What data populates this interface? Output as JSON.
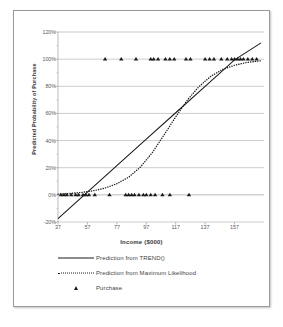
{
  "chart_data": {
    "type": "scatter",
    "title": "",
    "xlabel": "Income ($000)",
    "ylabel": "Predicted Probability of Purchase",
    "xlim": [
      37,
      177
    ],
    "ylim": [
      -0.2,
      1.2
    ],
    "xticks": [
      "37",
      "57",
      "77",
      "97",
      "117",
      "137",
      "157"
    ],
    "xtick_values": [
      37,
      57,
      77,
      97,
      117,
      137,
      157
    ],
    "yticks": [
      "-20%",
      "0%",
      "20%",
      "40%",
      "60%",
      "80%",
      "100%",
      "120%"
    ],
    "ytick_values": [
      -0.2,
      0.0,
      0.2,
      0.4,
      0.6,
      0.8,
      1.0,
      1.2
    ],
    "grid": "horizontal",
    "legend_position": "bottom",
    "series": [
      {
        "name": "Prediction from TREND()",
        "type": "line",
        "style": "solid",
        "color": "#1a1a1a",
        "x": [
          37,
          57,
          77,
          97,
          117,
          137,
          157,
          175
        ],
        "y": [
          -0.175,
          0.02,
          0.215,
          0.41,
          0.605,
          0.8,
          0.995,
          1.12
        ]
      },
      {
        "name": "Prediction from Maximum Likelihood",
        "type": "line",
        "style": "dotted",
        "color": "#1a1a1a",
        "x": [
          37,
          45,
          53,
          61,
          69,
          77,
          85,
          93,
          101,
          109,
          117,
          125,
          133,
          141,
          149,
          157,
          165,
          175
        ],
        "y": [
          0.005,
          0.01,
          0.018,
          0.03,
          0.05,
          0.082,
          0.13,
          0.205,
          0.31,
          0.44,
          0.575,
          0.7,
          0.8,
          0.875,
          0.925,
          0.955,
          0.975,
          0.988
        ]
      },
      {
        "name": "Purchase",
        "type": "scatter",
        "marker": "triangle",
        "color": "#1a1a1a",
        "points_y1_x": [
          69,
          80,
          90,
          100,
          102,
          105,
          110,
          113,
          116,
          124,
          127,
          137,
          140,
          143,
          148,
          152,
          155,
          157,
          159,
          161,
          163,
          166,
          169,
          172
        ],
        "points_y0_x": [
          39,
          41,
          43,
          46,
          49,
          51,
          54,
          56,
          58,
          62,
          72,
          83,
          85,
          87,
          89,
          92,
          95,
          97,
          100,
          103,
          108,
          113,
          126
        ]
      }
    ]
  },
  "axis": {
    "x_title": "Income ($000)",
    "y_title": "Predicted Probability of Purchase"
  },
  "legend": {
    "items": [
      {
        "label": "Prediction from TREND()",
        "key": "solid-line-key"
      },
      {
        "label": "Prediction from Maximum Likelihood",
        "key": "dotted-line-key"
      },
      {
        "label": "Purchase",
        "key": "triangle-marker-key"
      }
    ]
  },
  "colors": {
    "line": "#1a1a1a",
    "grid": "#b5b5b5",
    "axis_text": "#59595c",
    "title_text": "#3a3a3a",
    "frame": "#9a9a9a",
    "background": "#ffffff"
  }
}
